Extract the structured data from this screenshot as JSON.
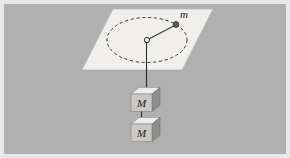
{
  "figure": {
    "background_color": "#b0b0b0",
    "border_color": "#e8e8e8",
    "plane": {
      "name": "horizontal-table-plane",
      "fill_color": "#f0efeb",
      "edge_color": "#b9b9b3"
    },
    "orbit": {
      "name": "dashed-circular-path",
      "style": "dashed",
      "stroke_color": "#3a3a3a"
    },
    "hub": {
      "name": "center-hole",
      "fill_color": "#f4f3ef",
      "stroke_color": "#2e2e2e"
    },
    "orbiting_mass": {
      "label": "m",
      "marker": "filled-dot",
      "fill_color": "#555555"
    },
    "radial_string": {
      "name": "radius-string",
      "stroke_color": "#3a3a3a"
    },
    "vertical_string": {
      "name": "hanging-string",
      "stroke_color": "#2b2b2b"
    },
    "blocks": [
      {
        "label": "M",
        "name": "hanging-block-upper",
        "front_color": "#c9c8c4",
        "top_color": "#eeede9",
        "side_color": "#8e8d89"
      },
      {
        "label": "M",
        "name": "hanging-block-lower",
        "front_color": "#c9c8c4",
        "top_color": "#eeede9",
        "side_color": "#8e8d89"
      }
    ]
  }
}
